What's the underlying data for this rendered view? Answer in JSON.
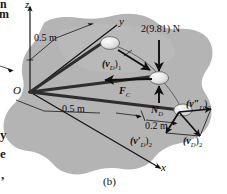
{
  "figure": {
    "caption": "(b)",
    "axes": {
      "z": "z",
      "y": "y",
      "x": "x",
      "origin": "O"
    },
    "dimensions": [
      {
        "id": "height",
        "text": "0.5 m"
      },
      {
        "id": "radius",
        "text": "0.5 m"
      },
      {
        "id": "offset",
        "text": "0.2 m"
      }
    ],
    "forces": [
      {
        "id": "weight",
        "text": "2(9.81) N"
      },
      {
        "id": "cord-force",
        "text": "F",
        "sub": "C"
      },
      {
        "id": "normal-force",
        "text": "N",
        "sub": "D"
      }
    ],
    "velocities": [
      {
        "id": "v-d-1",
        "text": "(v",
        "sub": "D",
        "suffix": ")",
        "index": "1"
      },
      {
        "id": "v-d-2-doubleprime",
        "text": "(v″",
        "sub": "D",
        "suffix": ")",
        "index": "2"
      },
      {
        "id": "v-d-2-prime",
        "text": "(v′",
        "sub": "D",
        "suffix": ")",
        "index": "2"
      },
      {
        "id": "v-d-2",
        "text": "(v",
        "sub": "D",
        "suffix": ")",
        "index": "2"
      }
    ],
    "colors": {
      "surface": "#b3b3b3",
      "ink": "#111111",
      "ball": "#e8e8e8",
      "page": "#ffffff"
    }
  },
  "page_edge": {
    "top_left_fragments": [
      "n",
      "m"
    ],
    "bottom_left_fragments": [
      "y",
      "e",
      ","
    ]
  }
}
